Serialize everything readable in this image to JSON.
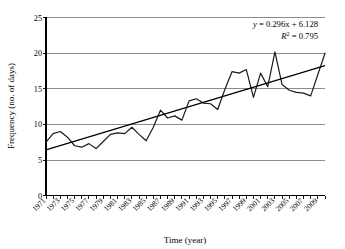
{
  "chart_data": {
    "type": "line",
    "title": "",
    "xlabel": "Time (year)",
    "ylabel": "Frequency (no. of days)",
    "xlim": [
      1971,
      2010
    ],
    "ylim": [
      0,
      25
    ],
    "ytick_values": [
      0,
      5,
      10,
      15,
      20,
      25
    ],
    "ytick_labels": [
      "0",
      "5",
      "10",
      "15",
      "20",
      "25"
    ],
    "xtick_labels": [
      "1971",
      "1973",
      "1975",
      "1977",
      "1979",
      "1981",
      "1983",
      "1985",
      "1987",
      "1989",
      "1991",
      "1993",
      "1995",
      "1997",
      "1999",
      "2001",
      "2003",
      "2005",
      "2007",
      "2009"
    ],
    "grid": "horizontal",
    "legend": "none",
    "x": [
      1971,
      1972,
      1973,
      1974,
      1975,
      1976,
      1977,
      1978,
      1979,
      1980,
      1981,
      1982,
      1983,
      1984,
      1985,
      1986,
      1987,
      1988,
      1989,
      1990,
      1991,
      1992,
      1993,
      1994,
      1995,
      1996,
      1997,
      1998,
      1999,
      2000,
      2001,
      2002,
      2003,
      2004,
      2005,
      2006,
      2007,
      2008,
      2009,
      2010
    ],
    "series": [
      {
        "name": "Frequency",
        "values": [
          7.5,
          8.7,
          9.0,
          8.2,
          7.0,
          6.8,
          7.3,
          6.6,
          7.6,
          8.6,
          8.8,
          8.7,
          9.6,
          8.6,
          7.7,
          9.6,
          12.0,
          10.9,
          11.2,
          10.6,
          13.3,
          13.6,
          13.0,
          12.9,
          12.1,
          14.9,
          17.4,
          17.2,
          17.7,
          13.8,
          17.2,
          15.3,
          20.2,
          15.6,
          14.8,
          14.5,
          14.4,
          14.0,
          17.0,
          20.0
        ]
      }
    ],
    "trendline": {
      "equation": "y = 0.296x + 6.128",
      "equation_y": "y",
      "equation_rest": " = 0.296x + 6.128",
      "r_squared_label": "R",
      "r_squared_sup": "2",
      "r_squared_value": " = 0.795",
      "slope": 0.296,
      "intercept": 6.128,
      "r2": 0.795,
      "start_value": 6.43,
      "end_value": 18.27
    },
    "colors": {
      "data_line": "#1a1a1a",
      "trend_line": "#000000",
      "grid": "#8c8c8c",
      "axis": "#000000",
      "background": "#ffffff"
    }
  }
}
